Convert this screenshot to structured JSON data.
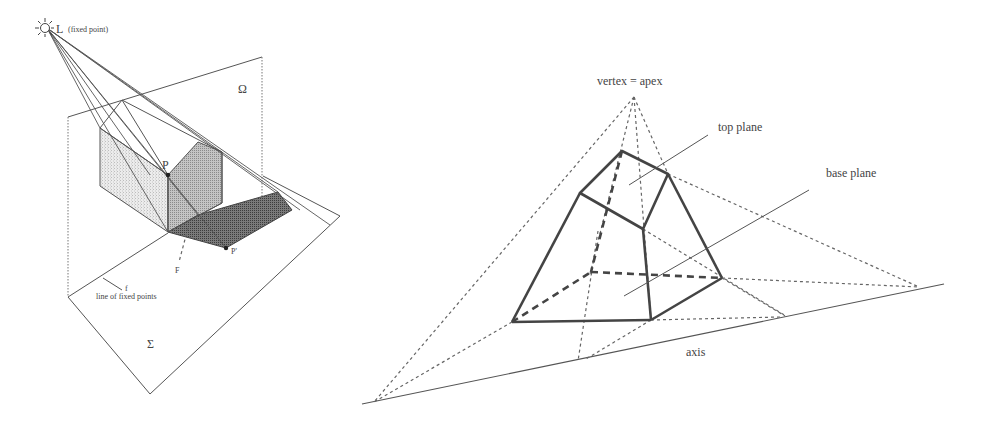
{
  "left_figure": {
    "light_label": "L",
    "light_caption": "(fixed point)",
    "plane_upper_label": "Ω",
    "plane_lower_label": "Σ",
    "point_label": "P",
    "image_point_label": "P'",
    "line_f_label": "f",
    "line_f_caption": "line of fixed points",
    "F_label": "F",
    "icons": {
      "light_source": "sun-icon"
    },
    "colors": {
      "light_face": "#d4d4d4",
      "mid_face": "#a8a8a8",
      "shadow": "#6e6e6e"
    }
  },
  "right_figure": {
    "vertex_label": "vertex = apex",
    "top_plane_label": "top plane",
    "base_plane_label": "base plane",
    "axis_label": "axis"
  }
}
